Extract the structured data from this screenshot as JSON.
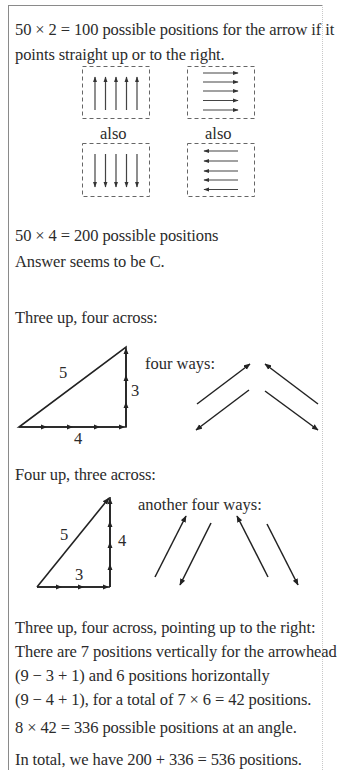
{
  "intro": {
    "line1": "50 × 2 = 100 possible positions for the arrow if it",
    "line2": "points straight up or to the right."
  },
  "arrow_grid_figure": {
    "boxes": [
      {
        "id": "up",
        "direction": "up",
        "arrow_count": 5
      },
      {
        "id": "right",
        "direction": "right",
        "arrow_count": 5
      },
      {
        "id": "down",
        "direction": "down",
        "arrow_count": 5
      },
      {
        "id": "left",
        "direction": "left",
        "arrow_count": 5
      }
    ],
    "label_left": "also",
    "label_right": "also"
  },
  "result_straight": "50 × 4 = 200 possible positions",
  "answer_guess": "Answer seems to be C.",
  "section1": {
    "heading": "Three up, four across:",
    "triangle": {
      "hypotenuse": "5",
      "vertical": "3",
      "horizontal": "4"
    },
    "ways_label": "four ways:"
  },
  "section2": {
    "heading": "Four up, three across:",
    "triangle": {
      "hypotenuse": "5",
      "vertical": "4",
      "horizontal": "3"
    },
    "ways_label": "another four ways:"
  },
  "explanation": {
    "line1": "Three up, four across, pointing up to the right:",
    "line2": "There are 7 positions vertically for the arrowhead",
    "line3": "(9 − 3 + 1) and 6 positions horizontally",
    "line4": "(9 − 4 + 1), for a total of 7 × 6 = 42 positions."
  },
  "result_angle": "8 × 42 = 336 possible positions at an angle.",
  "total": "In total, we have 200 + 336 = 536 positions."
}
